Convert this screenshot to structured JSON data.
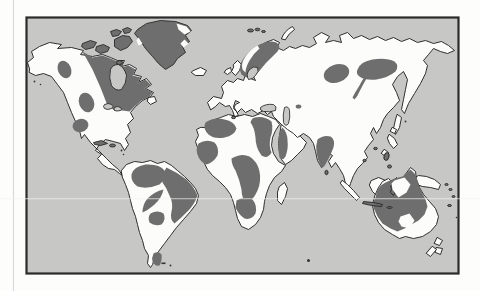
{
  "page": {
    "background": "#fdfdfc",
    "margin_rule_color": "#d9d9d9"
  },
  "figure": {
    "kind": "world-map-scan",
    "colors": {
      "ocean": "#c7c7c6",
      "land": "#fcfcfb",
      "outline": "#1c1c1c",
      "shaded": "#6e6e6e",
      "frame_border": "#2b2b2b",
      "scan_line": "#f2f2ef",
      "speckle": "#333333"
    },
    "shaded_regions": [
      "canadian-shield",
      "canadian-arctic-islands",
      "greenland",
      "western-north-america-patches",
      "guiana-amazon-shield",
      "east-brazil-shield",
      "central-brazil-patches",
      "patagonia-patch",
      "baltic-shield",
      "svalbard",
      "siberian-patches",
      "kazakh-patch",
      "northwest-africa",
      "west-africa",
      "northeast-africa",
      "central-east-africa",
      "southern-africa",
      "arabian-shield",
      "indian-shield",
      "western-australia",
      "new-guinea-west-tip"
    ]
  }
}
